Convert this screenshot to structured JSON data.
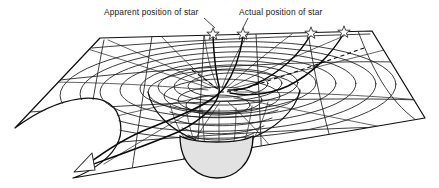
{
  "figure": {
    "background_color": "#ffffff",
    "line_color": "#101010",
    "sphere_fill_color": "#e2e2e2",
    "sphere_stroke_color": "#0d0d0d",
    "star_fill_color": "#ffffff",
    "star_stroke_color": "#2a2a2a"
  },
  "labels": {
    "apparent": {
      "text": "Apparent position of star",
      "x": 104,
      "y": 15
    },
    "actual": {
      "text": "Actual position of star",
      "x": 239,
      "y": 15
    }
  },
  "stars": [
    {
      "name": "star-apparent-position",
      "x": 213,
      "y": 33,
      "radius": 5.2
    },
    {
      "name": "star-actual-position",
      "x": 243,
      "y": 33,
      "radius": 5.0
    },
    {
      "name": "star-background-right-inner",
      "x": 311,
      "y": 32,
      "radius": 5.0
    },
    {
      "name": "star-background-right-outer",
      "x": 344,
      "y": 31,
      "radius": 5.0
    }
  ],
  "leaders": [
    {
      "name": "leader-apparent",
      "from_x": 205,
      "from_y": 19,
      "to_x": 215,
      "to_y": 28
    },
    {
      "name": "leader-actual",
      "from_x": 247,
      "from_y": 19,
      "to_x": 243,
      "to_y": 28
    }
  ],
  "sheet": {
    "description": "Warped two-dimensional spacetime sheet shown in perspective",
    "vertices": {
      "top_left": {
        "x": 100,
        "y": 38
      },
      "top_right": {
        "x": 372,
        "y": 31
      },
      "right": {
        "x": 425,
        "y": 118
      },
      "bottom": {
        "x": 73,
        "y": 178
      },
      "left": {
        "x": 15,
        "y": 128
      }
    }
  },
  "sphere": {
    "name": "massive-body",
    "center_x": 216,
    "center_y": 140,
    "radius_x": 36,
    "radius_y": 32
  },
  "observer_arrow": {
    "name": "observer-direction-arrow",
    "tip_x": 84,
    "tip_y": 168,
    "label": ""
  },
  "light_paths": [
    {
      "name": "light-path-actual-bent",
      "style": "solid",
      "description": "Actual curved path of light deflected by the gravity well"
    },
    {
      "name": "light-path-apparent-straight",
      "style": "dashed",
      "description": "Straight-line back-projection giving the apparent star position"
    }
  ]
}
